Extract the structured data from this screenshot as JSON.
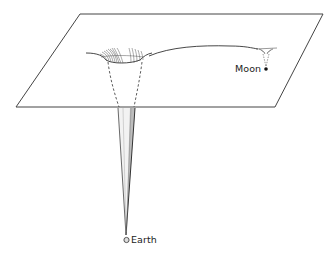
{
  "diagram": {
    "labels": {
      "moon": "Moon",
      "earth": "Earth"
    },
    "colors": {
      "line": "#333333",
      "plane_fill": "#ffffff",
      "cone_shade": "#bdbdbd",
      "background": "#ffffff"
    }
  }
}
